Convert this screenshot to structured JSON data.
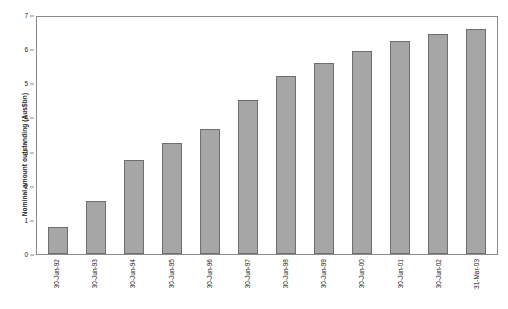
{
  "chart_data": {
    "type": "bar",
    "title": "",
    "subtitle": "",
    "xlabel": "",
    "ylabel": "Nominal amount outstanding (Aus$bn)",
    "categories": [
      "30-Jun-92",
      "30-Jun-93",
      "30-Jun-94",
      "30-Jun-95",
      "30-Jun-96",
      "30-Jun-97",
      "30-Jun-98",
      "30-Jun-99",
      "30-Jun-00",
      "30-Jun-01",
      "30-Jun-02",
      "31-Mar-03"
    ],
    "values": [
      0.8,
      1.55,
      2.75,
      3.25,
      3.65,
      4.5,
      5.2,
      5.6,
      5.95,
      6.25,
      6.45,
      6.6
    ],
    "ylim": [
      0,
      7
    ],
    "ytick_values": [
      0,
      1,
      2,
      3,
      4,
      5,
      6,
      7
    ],
    "ytick_labels": [
      "0",
      "1",
      "2",
      "3",
      "4",
      "5",
      "6",
      "7"
    ],
    "grid": false,
    "legend": null,
    "legend_position": "none",
    "bar_fill_color": "#a6a6a6",
    "bar_border_color": "#6e6e6e",
    "axis_color": "#8a8a8a",
    "text_color": "#1a1a1a",
    "background_color": "#ffffff"
  }
}
